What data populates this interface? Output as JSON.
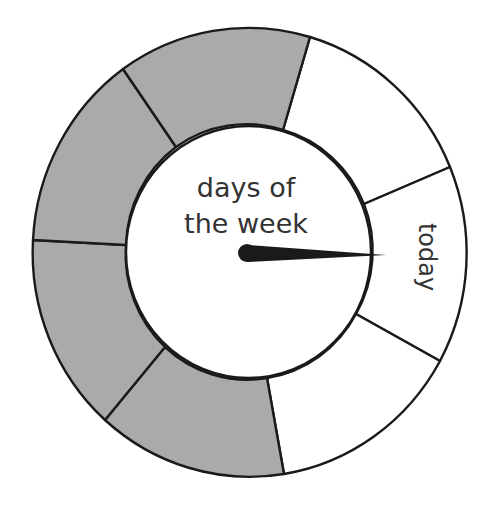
{
  "diagram": {
    "center_label_line1": "days of",
    "center_label_line2": "the week",
    "highlight_label": "today",
    "pointer_target": "today",
    "colors": {
      "filled_segment": "#aaaaaa",
      "empty_segment": "#ffffff",
      "outline": "#1a1a1a",
      "text": "#333333",
      "pointer": "#1a1a1a"
    },
    "segments": [
      {
        "index": 1,
        "state": "empty",
        "label": ""
      },
      {
        "index": 2,
        "state": "empty",
        "label": "today"
      },
      {
        "index": 3,
        "state": "empty",
        "label": ""
      },
      {
        "index": 4,
        "state": "filled",
        "label": ""
      },
      {
        "index": 5,
        "state": "filled",
        "label": ""
      },
      {
        "index": 6,
        "state": "filled",
        "label": ""
      },
      {
        "index": 7,
        "state": "filled",
        "label": ""
      }
    ],
    "segment_count": 7,
    "filled_count": 4
  }
}
